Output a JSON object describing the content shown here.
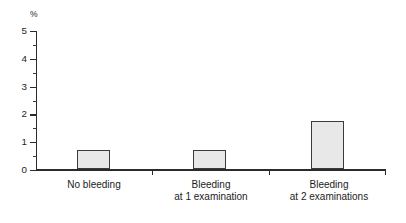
{
  "chart_data": {
    "type": "bar",
    "title": "",
    "subtitle": "",
    "xlabel": "",
    "ylabel": "%",
    "ylim": [
      0,
      5
    ],
    "ytick_step": 1,
    "yminor_step": 0.5,
    "grid": false,
    "legend": null,
    "categories": [
      "No bleeding",
      "Bleeding at 1 examination",
      "Bleeding at 2 examinations"
    ],
    "values": [
      0.7,
      0.7,
      1.75
    ],
    "bar_fill_color": "#e8e8e8",
    "bar_border_color": "#3b3b3b",
    "axis_color": "#2b2b2b"
  },
  "axis": {
    "unit_label": "%",
    "y_ticks": [
      {
        "value": "5"
      },
      {
        "value": "4"
      },
      {
        "value": "3"
      },
      {
        "value": "2"
      },
      {
        "value": "1"
      },
      {
        "value": "0"
      }
    ]
  },
  "categories": [
    {
      "line1": "No bleeding",
      "line2": ""
    },
    {
      "line1": "Bleeding",
      "line2": "at 1 examination"
    },
    {
      "line1": "Bleeding",
      "line2": "at 2 examinations"
    }
  ],
  "caption": {
    "cutoff_text": ""
  }
}
